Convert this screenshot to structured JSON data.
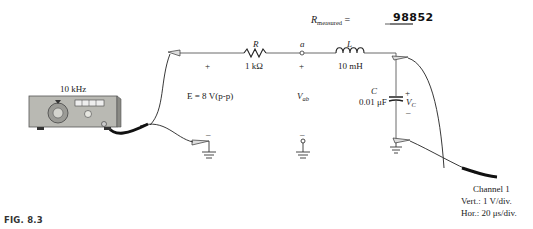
{
  "figure": {
    "caption": "FIG. 8.3",
    "r_measured": {
      "label": "R",
      "subscript": "measured",
      "equals": "=",
      "value": "98852"
    },
    "generator": {
      "frequency": "10 kHz",
      "source_label": "E = 8 V(p-p)"
    },
    "components": {
      "resistor": {
        "symbol": "R",
        "value": "1 kΩ"
      },
      "inductor": {
        "symbol": "L",
        "value": "10 mH"
      },
      "capacitor": {
        "symbol": "C",
        "value": "0.01 μF"
      }
    },
    "nodes": {
      "a": "a"
    },
    "polarity": {
      "plus": "+",
      "minus": "–"
    },
    "measurements": {
      "vab": "V",
      "vab_sub": "ab",
      "vc": "V",
      "vc_sub": "C"
    },
    "oscilloscope": {
      "channel": "Channel 1",
      "vert": "Vert.:  1 V/div.",
      "hor": "Hor.:  20 μs/div."
    }
  }
}
